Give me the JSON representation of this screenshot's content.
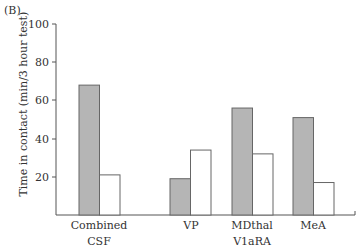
{
  "panel_label": "(B)",
  "chart_data": {
    "type": "bar",
    "title": "",
    "xlabel": "",
    "ylabel": "Time in contact (min/3 hour test)",
    "ylim": [
      0,
      100
    ],
    "yticks": [
      20,
      40,
      60,
      80,
      100
    ],
    "categories": [
      "Combined CSF",
      "VP",
      "MDthal",
      "MeA"
    ],
    "category_group_label": "V1aRA",
    "series": [
      {
        "name": "Series 1 (gray)",
        "color": "#b5b5b5",
        "values": [
          68,
          19,
          56,
          51
        ]
      },
      {
        "name": "Series 2 (white)",
        "color": "#ffffff",
        "values": [
          21,
          34,
          32,
          17
        ]
      }
    ],
    "legend": null,
    "grid": false
  },
  "labels": {
    "cat0_line1": "Combined",
    "cat0_line2": "CSF",
    "cat1": "VP",
    "cat2": "MDthal",
    "cat2_line2": "V1aRA",
    "cat3": "MeA"
  }
}
